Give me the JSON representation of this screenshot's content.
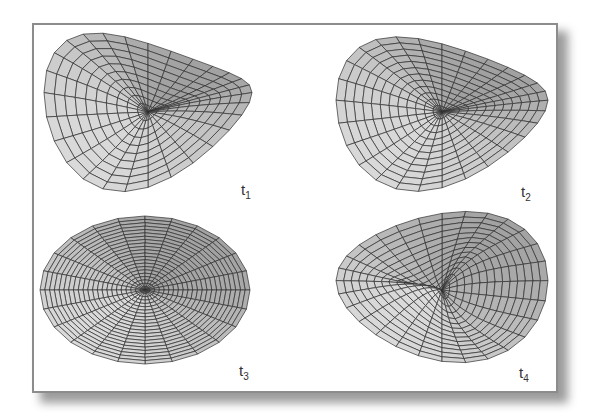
{
  "figure": {
    "panels": [
      {
        "id": "t1",
        "label": "t",
        "subscript": "1",
        "shape": "twisted-saddle",
        "position": "top-left"
      },
      {
        "id": "t2",
        "label": "t",
        "subscript": "2",
        "shape": "twisted-saddle-flatter",
        "position": "top-right"
      },
      {
        "id": "t3",
        "label": "t",
        "subscript": "3",
        "shape": "flat-disc",
        "position": "bottom-left"
      },
      {
        "id": "t4",
        "label": "t",
        "subscript": "4",
        "shape": "twisted-saddle-inverted",
        "position": "bottom-right"
      }
    ],
    "colors": {
      "mesh_fill_light": "#d6d6d6",
      "mesh_fill_dark": "#9a9a9a",
      "mesh_line": "#2e2e2e",
      "frame_border": "#8c8c8c"
    }
  }
}
